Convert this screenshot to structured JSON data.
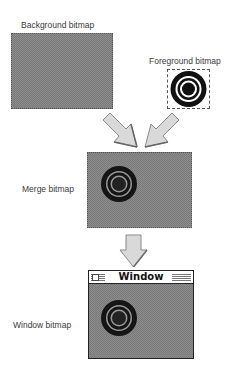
{
  "labels": {
    "background": "Background bitmap",
    "foreground": "Foreground bitmap",
    "merge": "Merge bitmap",
    "window": "Window bitmap"
  },
  "window": {
    "title": "Window"
  },
  "icons": {
    "target": "target-icon",
    "arrow_down_right": "arrow-down-right-icon",
    "arrow_down_left": "arrow-down-left-icon",
    "arrow_down": "arrow-down-icon",
    "close_box": "close-box-icon"
  },
  "colors": {
    "dither_gray": "#8c8c8c",
    "arrow_fill": "#d9d9d9",
    "arrow_edge": "#8a8a8a",
    "target_black": "#111111"
  }
}
